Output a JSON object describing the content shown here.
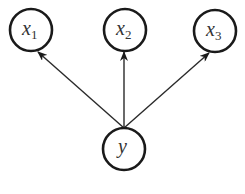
{
  "diagram": {
    "type": "directed-graph",
    "nodes": [
      {
        "id": "x1",
        "label": "x",
        "subscript": "1",
        "cx": 31,
        "cy": 30,
        "r": 21
      },
      {
        "id": "x2",
        "label": "x",
        "subscript": "2",
        "cx": 125,
        "cy": 30,
        "r": 21
      },
      {
        "id": "x3",
        "label": "x",
        "subscript": "3",
        "cx": 215,
        "cy": 31,
        "r": 21
      },
      {
        "id": "y",
        "label": "y",
        "subscript": "",
        "cx": 124,
        "cy": 149,
        "r": 21
      }
    ],
    "edges": [
      {
        "from": "y",
        "to": "x1"
      },
      {
        "from": "y",
        "to": "x2"
      },
      {
        "from": "y",
        "to": "x3"
      }
    ],
    "colors": {
      "stroke": "#1a1a1a",
      "edge": "#2a2a2a",
      "text": "#333333",
      "background": "#ffffff"
    }
  }
}
